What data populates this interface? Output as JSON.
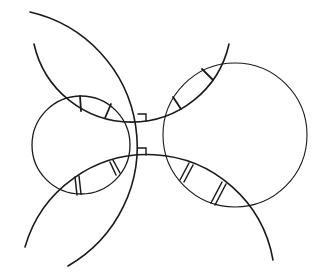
{
  "diagram": {
    "background": "#ffffff",
    "stroke_color": "#1a1a1a",
    "circles": [
      {
        "name": "left-circle",
        "cx": 81,
        "cy": 145,
        "r": 49,
        "stroke_width": 1.3
      },
      {
        "name": "right-circle",
        "cx": 235,
        "cy": 135,
        "r": 72,
        "stroke_width": 1.1
      }
    ],
    "arcs": [
      {
        "name": "arc-a",
        "d": "M 30 12 A 137.9 137.9 0 0 1 68 266",
        "stroke_width": 1.6
      },
      {
        "name": "arc-b",
        "d": "M 34 44 A 99.9 99.9 0 0 0 229 44",
        "stroke_width": 1.6
      },
      {
        "name": "arc-c",
        "d": "M 25 247 A 127.4 127.4 0 0 1 273 260",
        "stroke_width": 1.6
      }
    ],
    "single_ticks": [
      {
        "name": "tick-top-left-1",
        "x1": 80,
        "y1": 96,
        "x2": 81,
        "y2": 111
      },
      {
        "name": "tick-top-left-2",
        "x1": 111,
        "y1": 104,
        "x2": 105,
        "y2": 118
      },
      {
        "name": "tick-top-right-1",
        "x1": 202,
        "y1": 69,
        "x2": 213,
        "y2": 80
      },
      {
        "name": "tick-top-right-2",
        "x1": 173,
        "y1": 97,
        "x2": 181,
        "y2": 109
      }
    ],
    "double_ticks": [
      {
        "name": "double-tick-bottom-left-1",
        "lines": [
          [
            75,
            177,
            77,
            195
          ],
          [
            79,
            176,
            81,
            194
          ]
        ]
      },
      {
        "name": "double-tick-bottom-left-2",
        "lines": [
          [
            110,
            162,
            116,
            175
          ],
          [
            113,
            160,
            120,
            173
          ]
        ]
      },
      {
        "name": "double-tick-bottom-right-1",
        "lines": [
          [
            189,
            163,
            180,
            180
          ],
          [
            193,
            165,
            184,
            182
          ]
        ]
      },
      {
        "name": "double-tick-bottom-right-2",
        "lines": [
          [
            222,
            182,
            211,
            203
          ],
          [
            226,
            184,
            215,
            205
          ]
        ]
      }
    ],
    "right_angle_markers": [
      {
        "name": "right-angle-upper",
        "d": "M 138 114 L 146 114 L 146 121"
      },
      {
        "name": "right-angle-lower",
        "d": "M 138 148 L 146 148 L 146 155"
      }
    ]
  }
}
